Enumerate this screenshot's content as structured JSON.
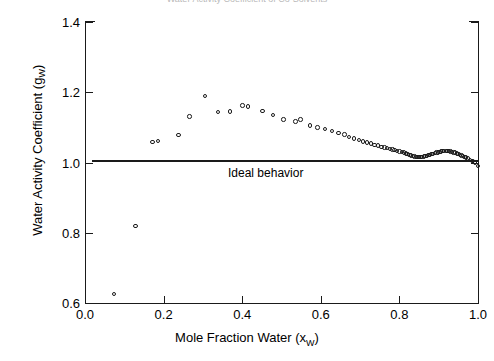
{
  "figure": {
    "cut_off_top_title": "Water Activity Coefficient of Co-Solvents"
  },
  "chart_data": {
    "type": "scatter",
    "title": "",
    "xlabel": "Mole Fraction Water (x_W)",
    "xlabel_main": "Mole Fraction Water (x",
    "xlabel_sub": "W",
    "xlabel_close": ")",
    "ylabel": "Water Activity Coefficient (g_W)",
    "ylabel_main": "Water Activity Coefficient (g",
    "ylabel_sub": "W",
    "ylabel_close": ")",
    "xlim": [
      0.0,
      1.0
    ],
    "ylim": [
      0.6,
      1.4
    ],
    "xticks": [
      "0.0",
      "0.2",
      "0.4",
      "0.6",
      "0.8",
      "1.0"
    ],
    "xtick_values": [
      0.0,
      0.2,
      0.4,
      0.6,
      0.8,
      1.0
    ],
    "yticks": [
      "0.6",
      "0.8",
      "1.0",
      "1.2",
      "1.4"
    ],
    "ytick_values": [
      0.6,
      0.8,
      1.0,
      1.2,
      1.4
    ],
    "grid": false,
    "legend": "none",
    "marker_style": "open-circle",
    "marker_color": "#1a1a1a",
    "annotations": [
      {
        "name": "ideal-behavior",
        "text": "Ideal behavior",
        "type": "horizontal-line",
        "y": 1.0,
        "x_start": 0.018,
        "x_end": 1.0
      }
    ],
    "series": [
      {
        "name": "Water activity coefficient",
        "x": [
          0.073,
          0.128,
          0.172,
          0.186,
          0.238,
          0.266,
          0.305,
          0.338,
          0.369,
          0.401,
          0.414,
          0.452,
          0.478,
          0.505,
          0.536,
          0.548,
          0.573,
          0.592,
          0.61,
          0.628,
          0.645,
          0.66,
          0.672,
          0.684,
          0.697,
          0.708,
          0.718,
          0.728,
          0.737,
          0.746,
          0.754,
          0.762,
          0.769,
          0.776,
          0.782,
          0.788,
          0.794,
          0.8,
          0.806,
          0.811,
          0.816,
          0.821,
          0.826,
          0.83,
          0.834,
          0.838,
          0.842,
          0.846,
          0.85,
          0.854,
          0.858,
          0.862,
          0.866,
          0.87,
          0.874,
          0.878,
          0.882,
          0.886,
          0.89,
          0.894,
          0.898,
          0.902,
          0.906,
          0.91,
          0.914,
          0.918,
          0.922,
          0.926,
          0.93,
          0.934,
          0.938,
          0.942,
          0.946,
          0.95,
          0.954,
          0.958,
          0.962,
          0.966,
          0.97,
          0.975,
          0.98,
          0.986,
          0.993,
          1.0
        ],
        "y": [
          0.625,
          0.82,
          1.058,
          1.062,
          1.078,
          1.131,
          1.19,
          1.143,
          1.145,
          1.162,
          1.16,
          1.146,
          1.135,
          1.122,
          1.117,
          1.122,
          1.105,
          1.1,
          1.096,
          1.089,
          1.084,
          1.08,
          1.072,
          1.068,
          1.064,
          1.06,
          1.057,
          1.054,
          1.05,
          1.048,
          1.045,
          1.043,
          1.041,
          1.039,
          1.037,
          1.035,
          1.033,
          1.031,
          1.03,
          1.028,
          1.026,
          1.024,
          1.022,
          1.02,
          1.018,
          1.017,
          1.016,
          1.015,
          1.015,
          1.015,
          1.016,
          1.017,
          1.018,
          1.019,
          1.021,
          1.022,
          1.024,
          1.025,
          1.027,
          1.028,
          1.029,
          1.03,
          1.031,
          1.032,
          1.032,
          1.032,
          1.032,
          1.032,
          1.031,
          1.03,
          1.029,
          1.028,
          1.026,
          1.024,
          1.022,
          1.02,
          1.018,
          1.016,
          1.014,
          1.011,
          1.008,
          1.005,
          1.0,
          0.99
        ]
      }
    ]
  }
}
